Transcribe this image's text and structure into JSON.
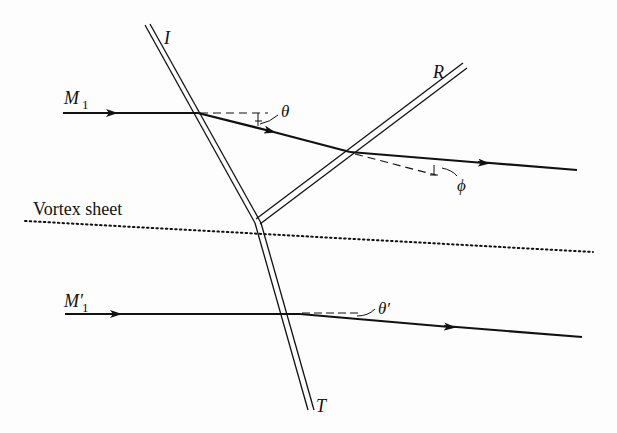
{
  "figure": {
    "labels": {
      "incident_shock": "I",
      "reflected_shock": "R",
      "transmitted_shock": "T",
      "upper_stream_mach": "M",
      "upper_stream_mach_sub": "1",
      "lower_stream_mach": "M′",
      "lower_stream_mach_sub": "1",
      "theta": "θ",
      "phi": "ϕ",
      "theta_prime": "θ′",
      "vortex_sheet": "Vortex sheet"
    },
    "colors": {
      "ink": "#111111",
      "background": "#fdfdfd"
    }
  }
}
